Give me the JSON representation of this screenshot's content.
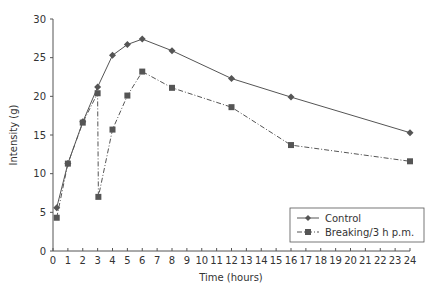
{
  "chart_data": {
    "type": "line",
    "title": "",
    "xlabel": "Time (hours)",
    "ylabel": "Intensity (g)",
    "xlim": [
      0,
      24
    ],
    "ylim": [
      0,
      30
    ],
    "x_ticks": [
      0,
      1,
      2,
      3,
      4,
      5,
      6,
      7,
      8,
      9,
      10,
      11,
      12,
      13,
      14,
      15,
      16,
      17,
      18,
      19,
      20,
      21,
      22,
      23,
      24
    ],
    "y_ticks": [
      0,
      5,
      10,
      15,
      20,
      25,
      30
    ],
    "grid": false,
    "legend_position": "lower right",
    "series": [
      {
        "name": "Control",
        "marker": "diamond",
        "line_style": "solid",
        "color": "#555555",
        "x": [
          0.25,
          1,
          2,
          3,
          4,
          5,
          6,
          8,
          12,
          16,
          24
        ],
        "y": [
          5.6,
          11.3,
          16.7,
          21.2,
          25.3,
          26.7,
          27.4,
          25.9,
          22.3,
          19.9,
          15.3
        ]
      },
      {
        "name": "Breaking/3 h p.m.",
        "marker": "square",
        "line_style": "dash-dot",
        "color": "#555555",
        "x": [
          0.25,
          1,
          2,
          3,
          3.05,
          4,
          5,
          6,
          8,
          12,
          16,
          24
        ],
        "y": [
          4.3,
          11.3,
          16.6,
          20.4,
          7.0,
          15.7,
          20.1,
          23.2,
          21.1,
          18.6,
          13.7,
          11.6
        ]
      }
    ]
  }
}
